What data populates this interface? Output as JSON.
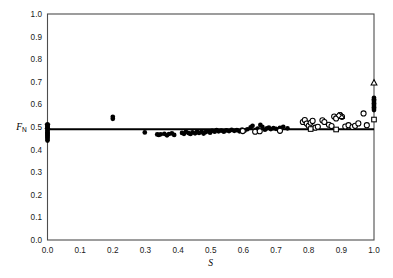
{
  "figure": {
    "background_color": "#ffffff",
    "frame_color": "#4d4d4d",
    "marker_color": "#000000"
  },
  "axes": {
    "x_label": "S",
    "y_label_main": "F",
    "y_label_sub": "N",
    "x_ticks": [
      "0.0",
      "0.1",
      "0.2",
      "0.3",
      "0.4",
      "0.5",
      "0.6",
      "0.7",
      "0.8",
      "0.9",
      "1.0"
    ],
    "y_ticks": [
      "0.0",
      "0.1",
      "0.2",
      "0.3",
      "0.4",
      "0.5",
      "0.6",
      "0.7",
      "0.8",
      "0.9",
      "1.0"
    ]
  },
  "chart_data": {
    "type": "scatter",
    "title": "",
    "xlabel": "S",
    "ylabel": "F_N",
    "xlim": [
      0.0,
      1.0
    ],
    "ylim": [
      0.0,
      1.0
    ],
    "grid": false,
    "legend": "none",
    "annotations": [
      {
        "kind": "horizontal-reference-line",
        "y": 0.49,
        "x_start": 0.0,
        "x_end": 1.0,
        "color": "#000000"
      }
    ],
    "series": [
      {
        "name": "filled-circles",
        "marker": "filled-circle",
        "points": [
          [
            0.0,
            0.44
          ],
          [
            0.0,
            0.447
          ],
          [
            0.0,
            0.452
          ],
          [
            0.0,
            0.457
          ],
          [
            0.0,
            0.462
          ],
          [
            0.0,
            0.467
          ],
          [
            0.0,
            0.472
          ],
          [
            0.0,
            0.477
          ],
          [
            0.0,
            0.482
          ],
          [
            0.0,
            0.487
          ],
          [
            0.0,
            0.492
          ],
          [
            0.0,
            0.497
          ],
          [
            0.0,
            0.502
          ],
          [
            0.0,
            0.507
          ],
          [
            0.0,
            0.512
          ],
          [
            0.2,
            0.536
          ],
          [
            0.2,
            0.545
          ],
          [
            0.298,
            0.476
          ],
          [
            0.336,
            0.467
          ],
          [
            0.341,
            0.465
          ],
          [
            0.347,
            0.468
          ],
          [
            0.358,
            0.47
          ],
          [
            0.366,
            0.463
          ],
          [
            0.372,
            0.469
          ],
          [
            0.381,
            0.472
          ],
          [
            0.388,
            0.465
          ],
          [
            0.412,
            0.474
          ],
          [
            0.418,
            0.47
          ],
          [
            0.424,
            0.478
          ],
          [
            0.432,
            0.473
          ],
          [
            0.438,
            0.469
          ],
          [
            0.444,
            0.476
          ],
          [
            0.452,
            0.472
          ],
          [
            0.458,
            0.48
          ],
          [
            0.464,
            0.474
          ],
          [
            0.472,
            0.478
          ],
          [
            0.478,
            0.471
          ],
          [
            0.484,
            0.477
          ],
          [
            0.492,
            0.481
          ],
          [
            0.498,
            0.475
          ],
          [
            0.504,
            0.483
          ],
          [
            0.512,
            0.479
          ],
          [
            0.518,
            0.486
          ],
          [
            0.524,
            0.481
          ],
          [
            0.532,
            0.484
          ],
          [
            0.54,
            0.479
          ],
          [
            0.548,
            0.485
          ],
          [
            0.556,
            0.482
          ],
          [
            0.564,
            0.487
          ],
          [
            0.572,
            0.483
          ],
          [
            0.58,
            0.486
          ],
          [
            0.588,
            0.481
          ],
          [
            0.596,
            0.488
          ],
          [
            0.604,
            0.484
          ],
          [
            0.612,
            0.49
          ],
          [
            0.622,
            0.498
          ],
          [
            0.628,
            0.505
          ],
          [
            0.638,
            0.487
          ],
          [
            0.644,
            0.493
          ],
          [
            0.652,
            0.509
          ],
          [
            0.658,
            0.501
          ],
          [
            0.666,
            0.488
          ],
          [
            0.672,
            0.494
          ],
          [
            0.678,
            0.497
          ],
          [
            0.684,
            0.491
          ],
          [
            0.692,
            0.495
          ],
          [
            0.7,
            0.492
          ],
          [
            0.712,
            0.496
          ],
          [
            0.722,
            0.501
          ],
          [
            0.735,
            0.494
          ]
        ]
      },
      {
        "name": "open-circles",
        "marker": "open-circle",
        "points": [
          [
            0.598,
            0.482
          ],
          [
            0.636,
            0.479
          ],
          [
            0.65,
            0.481
          ],
          [
            0.712,
            0.483
          ],
          [
            0.782,
            0.522
          ],
          [
            0.788,
            0.531
          ],
          [
            0.794,
            0.515
          ],
          [
            0.8,
            0.505
          ],
          [
            0.806,
            0.519
          ],
          [
            0.812,
            0.527
          ],
          [
            0.82,
            0.497
          ],
          [
            0.828,
            0.501
          ],
          [
            0.842,
            0.53
          ],
          [
            0.848,
            0.522
          ],
          [
            0.862,
            0.51
          ],
          [
            0.87,
            0.504
          ],
          [
            0.878,
            0.546
          ],
          [
            0.884,
            0.538
          ],
          [
            0.896,
            0.553
          ],
          [
            0.902,
            0.545
          ],
          [
            0.912,
            0.502
          ],
          [
            0.922,
            0.508
          ],
          [
            0.934,
            0.5
          ],
          [
            0.942,
            0.505
          ],
          [
            0.952,
            0.516
          ],
          [
            0.968,
            0.56
          ],
          [
            0.978,
            0.508
          ]
        ]
      },
      {
        "name": "open-squares",
        "marker": "open-square",
        "points": [
          [
            0.806,
            0.491
          ],
          [
            0.884,
            0.489
          ],
          [
            1.0,
            0.533
          ]
        ]
      },
      {
        "name": "open-triangles",
        "marker": "open-triangle",
        "points": [
          [
            0.9,
            0.547
          ],
          [
            1.0,
            0.695
          ]
        ]
      },
      {
        "name": "open-diamonds",
        "marker": "open-diamond",
        "points": [
          [
            0.892,
            0.551
          ]
        ]
      },
      {
        "name": "cluster-at-s-one",
        "marker": "filled-circle",
        "points": [
          [
            1.0,
            0.575
          ],
          [
            1.0,
            0.581
          ],
          [
            1.0,
            0.587
          ],
          [
            1.0,
            0.593
          ],
          [
            1.0,
            0.599
          ],
          [
            1.0,
            0.605
          ],
          [
            1.0,
            0.611
          ],
          [
            1.0,
            0.617
          ],
          [
            1.0,
            0.623
          ],
          [
            1.0,
            0.629
          ]
        ]
      },
      {
        "name": "cross-marker",
        "marker": "cross",
        "points": [
          [
            0.0,
            0.503
          ]
        ]
      }
    ]
  }
}
